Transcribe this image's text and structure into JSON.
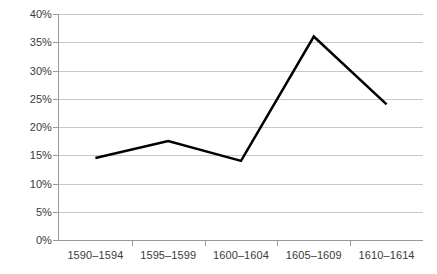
{
  "chart_data": {
    "type": "line",
    "title": "",
    "subtitle": "",
    "xlabel": "",
    "ylabel": "",
    "categories": [
      "1590–1594",
      "1595–1599",
      "1600–1604",
      "1605–1609",
      "1610–1614"
    ],
    "series": [
      {
        "name": "",
        "values": [
          14.5,
          17.5,
          14.0,
          36.0,
          24.0
        ]
      }
    ],
    "ylim": [
      0,
      40
    ],
    "ytick_step": 5,
    "ytick_labels": [
      "0%",
      "5%",
      "10%",
      "15%",
      "20%",
      "25%",
      "30%",
      "35%",
      "40%"
    ],
    "ytick_values": [
      0,
      5,
      10,
      15,
      20,
      25,
      30,
      35,
      40
    ],
    "value_suffix": "%",
    "grid": true,
    "grid_axis": "y",
    "legend": false,
    "legend_position": "none",
    "markers": false,
    "colors": {
      "line": "#000000",
      "gridline": "#c8c8c8",
      "axis": "#9a9a9a",
      "tick_label": "#3b3b3b",
      "background": "#ffffff"
    },
    "line_width": 2.5
  }
}
